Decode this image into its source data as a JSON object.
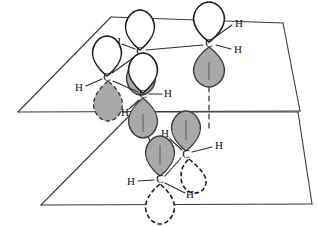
{
  "figure": {
    "kind": "chemistry-orbital-diagram",
    "colors": {
      "lobe_shaded": "#a9a9a9",
      "lobe_unshaded": "#ffffff",
      "outline": "#1c1c1c",
      "plane_edge": "#3a3a3a",
      "background": "#ffffff"
    }
  },
  "planes": [
    {
      "name": "upper-plane",
      "points": "111,17 283,23 300,111 18,112"
    },
    {
      "name": "lower-plane",
      "points": "133,112 298,112 312,204 41,205"
    }
  ],
  "atoms": [
    {
      "id": "c1",
      "element": "C",
      "x": 140,
      "y": 52,
      "plane": "upper",
      "lobe_up": "white",
      "lobe_down": "gray"
    },
    {
      "id": "c2",
      "element": "C",
      "x": 209,
      "y": 44,
      "plane": "upper",
      "lobe_up": "white",
      "lobe_down": "gray"
    },
    {
      "id": "c3",
      "element": "C",
      "x": 107,
      "y": 78,
      "plane": "upper",
      "lobe_up": "white",
      "lobe_down": "gray"
    },
    {
      "id": "c4",
      "element": "C",
      "x": 143,
      "y": 95,
      "plane": "upper",
      "lobe_up": "white",
      "lobe_down": "gray"
    },
    {
      "id": "c5",
      "element": "C",
      "x": 186,
      "y": 155,
      "plane": "lower",
      "lobe_up": "gray",
      "lobe_down": "white-dashed"
    },
    {
      "id": "c6",
      "element": "C",
      "x": 160,
      "y": 180,
      "plane": "lower",
      "lobe_up": "gray",
      "lobe_down": "white-dashed"
    }
  ],
  "hydrogens": [
    {
      "id": "h1",
      "element": "H",
      "x": 117,
      "y": 42,
      "bonded_to": "c1"
    },
    {
      "id": "h2",
      "element": "H",
      "x": 239,
      "y": 24,
      "bonded_to": "c2"
    },
    {
      "id": "h3",
      "element": "H",
      "x": 238,
      "y": 50,
      "bonded_to": "c2"
    },
    {
      "id": "h4",
      "element": "H",
      "x": 79,
      "y": 88,
      "bonded_to": "c3"
    },
    {
      "id": "h5",
      "element": "H",
      "x": 168,
      "y": 94,
      "bonded_to": "c4"
    },
    {
      "id": "h6",
      "element": "H",
      "x": 125,
      "y": 113,
      "bonded_to": "c4"
    },
    {
      "id": "h7",
      "element": "H",
      "x": 165,
      "y": 134,
      "bonded_to": "c5"
    },
    {
      "id": "h8",
      "element": "H",
      "x": 219,
      "y": 146,
      "bonded_to": "c5"
    },
    {
      "id": "h9",
      "element": "H",
      "x": 131,
      "y": 182,
      "bonded_to": "c6"
    },
    {
      "id": "h10",
      "element": "H",
      "x": 190,
      "y": 195,
      "bonded_to": "c6"
    }
  ],
  "pi_links": [
    {
      "from": "c2",
      "to": "c5",
      "style": "dashed"
    },
    {
      "from": "c4",
      "to": "c6",
      "style": "dashed"
    }
  ]
}
